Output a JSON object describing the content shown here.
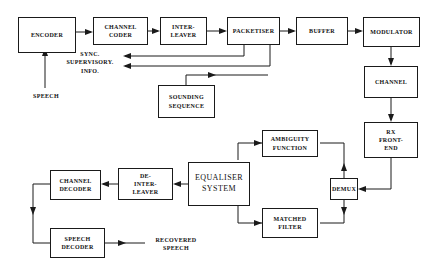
{
  "diagram": {
    "stroke_color": "#1a1a1a",
    "background_color": "#ffffff",
    "blocks": [
      {
        "id": "encoder",
        "label": "ENCODER"
      },
      {
        "id": "channel-coder",
        "label": "CHANNEL\nCODER"
      },
      {
        "id": "interleaver",
        "label": "INTER-\nLEAVER"
      },
      {
        "id": "packetiser",
        "label": "PACKETISER"
      },
      {
        "id": "buffer",
        "label": "BUFFER"
      },
      {
        "id": "modulator",
        "label": "MODULATOR"
      },
      {
        "id": "channel",
        "label": "CHANNEL"
      },
      {
        "id": "rx-front-end",
        "label": "RX\nFRONT-\nEND"
      },
      {
        "id": "sounding-sequence",
        "label": "SOUNDING\nSEQUENCE"
      },
      {
        "id": "demux",
        "label": "DEMUX"
      },
      {
        "id": "ambiguity-function",
        "label": "AMBIGUITY\nFUNCTION"
      },
      {
        "id": "matched-filter",
        "label": "MATCHED\nFILTER"
      },
      {
        "id": "equaliser-system",
        "label": "EQUALISER\nSYSTEM"
      },
      {
        "id": "de-interleaver",
        "label": "DE-\nINTER-\nLEAVER"
      },
      {
        "id": "channel-decoder",
        "label": "CHANNEL\nDECODER"
      },
      {
        "id": "speech-decoder",
        "label": "SPEECH\nDECODER"
      }
    ],
    "annotations": [
      {
        "id": "speech-input",
        "label": "SPEECH"
      },
      {
        "id": "sync-supervisory",
        "label": "SYNC.\nSUPERVISORY.\nINFO."
      },
      {
        "id": "recovered-speech",
        "label": "RECOVERED\nSPEECH"
      }
    ]
  }
}
